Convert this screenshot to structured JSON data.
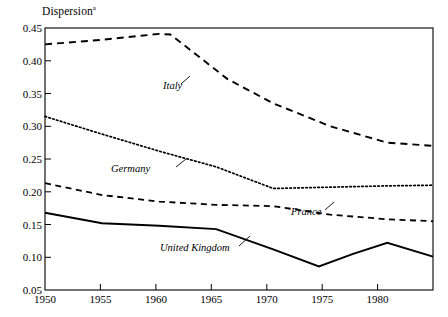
{
  "chart_data": {
    "type": "line",
    "title": "",
    "ylabel": "Dispersion",
    "ylabel_superscript": "a",
    "xlabel": "",
    "xlim": [
      1950,
      1984
    ],
    "ylim": [
      0.05,
      0.45
    ],
    "yticks": [
      "0.45",
      "0.40",
      "0.35",
      "0.30",
      "0.25",
      "0.20",
      "0.15",
      "0.10",
      "0.05"
    ],
    "ytick_values": [
      0.45,
      0.4,
      0.35,
      0.3,
      0.25,
      0.2,
      0.15,
      0.1,
      0.05
    ],
    "xticks": [
      "1950",
      "1955",
      "1960",
      "1965",
      "1970",
      "1975",
      "1980"
    ],
    "xtick_values": [
      1950,
      1955,
      1960,
      1965,
      1970,
      1975,
      1980
    ],
    "grid": false,
    "legend_position": "inline-annotations",
    "series": [
      {
        "name": "Italy",
        "style": "dashed",
        "color": "#000000",
        "x": [
          1950,
          1955,
          1960,
          1961,
          1966,
          1970,
          1975,
          1980,
          1984
        ],
        "values": [
          0.425,
          0.432,
          0.441,
          0.44,
          0.372,
          0.335,
          0.3,
          0.275,
          0.27
        ]
      },
      {
        "name": "Germany",
        "style": "dotted",
        "color": "#000000",
        "x": [
          1950,
          1955,
          1960,
          1965,
          1970,
          1975,
          1980,
          1984
        ],
        "values": [
          0.315,
          0.288,
          0.262,
          0.238,
          0.205,
          0.207,
          0.209,
          0.21
        ]
      },
      {
        "name": "France",
        "style": "dashed",
        "color": "#000000",
        "x": [
          1950,
          1955,
          1960,
          1965,
          1970,
          1975,
          1980,
          1984
        ],
        "values": [
          0.213,
          0.195,
          0.185,
          0.18,
          0.178,
          0.165,
          0.158,
          0.155
        ]
      },
      {
        "name": "United Kingdom",
        "style": "solid",
        "color": "#000000",
        "x": [
          1950,
          1955,
          1960,
          1965,
          1970,
          1974,
          1977,
          1980,
          1984
        ],
        "values": [
          0.168,
          0.152,
          0.148,
          0.143,
          0.112,
          0.086,
          0.105,
          0.122,
          0.101
        ]
      }
    ],
    "annotations": [
      {
        "text": "Italy",
        "x_px": 163,
        "y_px": 88
      },
      {
        "text": "Germany",
        "x_px": 133,
        "y_px": 171
      },
      {
        "text": "France",
        "x_px": 297,
        "y_px": 214
      },
      {
        "text": "United Kingdom",
        "x_px": 162,
        "y_px": 250
      }
    ]
  }
}
